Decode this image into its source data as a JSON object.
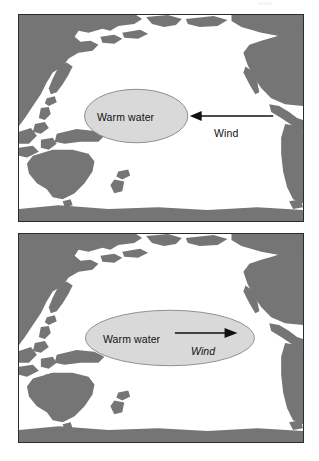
{
  "figure": {
    "colors": {
      "land": "#757575",
      "ocean": "#ffffff",
      "warm_pool": "#d9d9d9",
      "warm_pool_outline": "#8f8f8f",
      "border": "#2b2b2b",
      "ink": "#111111",
      "page_background": "#ffffff"
    }
  },
  "panels": [
    {
      "id": "panel-top",
      "name": "normal-conditions-panel",
      "warm_pool_label": "Warm water",
      "wind_label": "Wind",
      "wind_label_style": "regular",
      "wind_direction": "east-to-west",
      "arrow_points_left": true,
      "warm_pool": {
        "cx": 137,
        "cy": 117,
        "rx": 52,
        "ry": 27
      },
      "arrow": {
        "x1": 274,
        "y1": 117,
        "x2": 193,
        "y2": 117
      },
      "wind_label_pos": {
        "x": 213,
        "y": 129
      },
      "warm_pool_label_pos": {
        "x": 137,
        "y": 117
      }
    },
    {
      "id": "panel-bottom",
      "name": "el-nino-conditions-panel",
      "warm_pool_label": "Warm water",
      "wind_label": "Wind",
      "wind_label_style": "italic",
      "wind_direction": "west-to-east",
      "arrow_points_left": false,
      "warm_pool": {
        "cx": 170,
        "cy": 338,
        "rx": 85,
        "ry": 28
      },
      "arrow": {
        "x1": 175,
        "y1": 334,
        "x2": 237,
        "y2": 334
      },
      "wind_label_pos": {
        "x": 204,
        "y": 348
      },
      "warm_pool_label_pos": {
        "x": 139,
        "y": 333
      }
    }
  ],
  "map_features": {
    "regions": [
      "Asia",
      "Japan",
      "Philippines",
      "Indonesia",
      "New Guinea",
      "Australia",
      "New Zealand",
      "North America",
      "Central America",
      "South America",
      "Antarctica"
    ]
  }
}
